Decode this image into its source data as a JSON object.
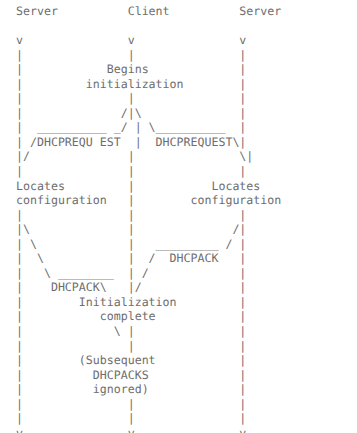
{
  "document": {
    "kind": "ascii-art-diagram",
    "title": "DHCP Client-Server Interaction",
    "background_color": "#ffffff",
    "text_color": "#6d6d6d",
    "char_width_px": 7,
    "line_height_px": 14.55,
    "columns": {
      "left_label": "Server",
      "center_label": "Client",
      "right_label": "Server"
    },
    "participants": [
      {
        "name": "server-left",
        "label": "Server",
        "column": 0
      },
      {
        "name": "client",
        "label": "Client",
        "column": 1
      },
      {
        "name": "server-right",
        "label": "Server",
        "column": 2
      }
    ],
    "annotations": [
      "Begins initialization",
      "DHCPREQUEST",
      "DHCPREQUEST",
      "Locates configuration",
      "Locates configuration",
      "DHCPACK",
      "DHCPACK",
      "Initialization complete",
      "(Subsequent DHCPACKS ignored)"
    ],
    "messages": [
      {
        "name": "dhcprequest-left",
        "label": "DHCPREQU EST",
        "direction": "client-to-server-left"
      },
      {
        "name": "dhcprequest-right",
        "label": "DHCPREQUEST",
        "direction": "client-to-server-right"
      },
      {
        "name": "dhcpack-left",
        "label": "DHCPACK",
        "direction": "server-left-to-client"
      },
      {
        "name": "dhcpack-right",
        "label": "DHCPACK",
        "direction": "server-right-to-client"
      }
    ],
    "ascii": "Server          Client          Server\n\nv               v               v\n|               |               |\n|            Begins             |\n|         initialization        |\n|               |               |\n|              /|\\              |\n|  __________ _/ | \\__________  |\n| /DHCPREQU EST  |  DHCPREQUEST\\|\n|/              |               \\|\n|               |               |\nLocates         |           Locates\nconfiguration   |        configuration\n|               |               |\n|\\              |              /|\n| \\             |   _________ / |\n|  \\            |  /  DHCPACK   |\n|   \\ ________  | /             |\n|    DHCPACK\\   |/              |\n|        Initialization         |\n|           complete            |\n|             \\ |               |\n|               |               |\n|        (Subsequent            |\n|          DHCPACKS             |\n|          ignored)             |\n|               |               |\n|               |               |\nv               v               v"
  }
}
